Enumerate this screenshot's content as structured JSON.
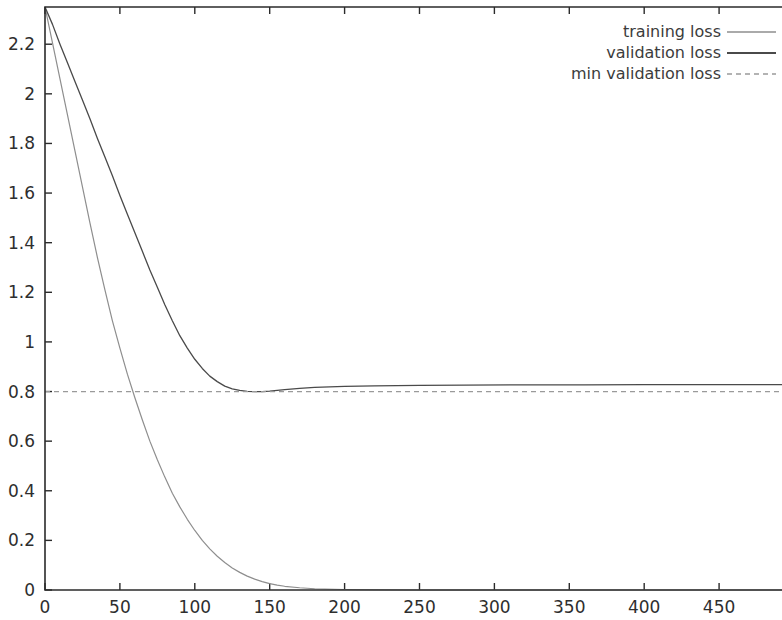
{
  "chart_data": {
    "type": "line",
    "title": "",
    "subtitle": "",
    "xlabel": "",
    "ylabel": "",
    "xlim": [
      0,
      492
    ],
    "ylim": [
      0,
      2.35
    ],
    "grid": false,
    "legend_position": "top-right",
    "x_ticks": [
      0,
      50,
      100,
      150,
      200,
      250,
      300,
      350,
      400,
      450
    ],
    "x_tick_labels": [
      "0",
      "50",
      "100",
      "150",
      "200",
      "250",
      "300",
      "350",
      "400",
      "450"
    ],
    "y_ticks": [
      0,
      0.2,
      0.4,
      0.6,
      0.8,
      1,
      1.2,
      1.4,
      1.6,
      1.8,
      2,
      2.2
    ],
    "y_tick_labels": [
      "0",
      "0.2",
      "0.4",
      "0.6",
      "0.8",
      "1",
      "1.2",
      "1.4",
      "1.6",
      "1.8",
      "2",
      "2.2"
    ],
    "annotations": [],
    "series": [
      {
        "name": "training loss",
        "style": "solid",
        "color": "#8e8e8e",
        "width": 1.2,
        "x": [
          0,
          5,
          10,
          15,
          20,
          25,
          30,
          35,
          40,
          45,
          50,
          55,
          60,
          65,
          70,
          75,
          80,
          85,
          90,
          95,
          100,
          105,
          110,
          115,
          120,
          125,
          130,
          135,
          140,
          145,
          150,
          155,
          160,
          170,
          180,
          200,
          220,
          250,
          280,
          320,
          360,
          400,
          440,
          492
        ],
        "values": [
          2.35,
          2.205,
          2.06,
          1.915,
          1.77,
          1.625,
          1.48,
          1.34,
          1.21,
          1.085,
          0.975,
          0.87,
          0.775,
          0.685,
          0.6,
          0.525,
          0.455,
          0.39,
          0.335,
          0.285,
          0.24,
          0.2,
          0.166,
          0.136,
          0.111,
          0.089,
          0.071,
          0.056,
          0.044,
          0.034,
          0.026,
          0.02,
          0.015,
          0.009,
          0.005,
          0.002,
          0.001,
          0.0,
          0.0,
          0.0,
          0.0,
          0.0,
          0.0,
          0.0
        ]
      },
      {
        "name": "validation loss",
        "style": "solid",
        "color": "#4a4a4a",
        "width": 1.3,
        "x": [
          0,
          5,
          10,
          15,
          20,
          25,
          30,
          35,
          40,
          45,
          50,
          55,
          60,
          65,
          70,
          75,
          80,
          85,
          90,
          95,
          100,
          105,
          110,
          115,
          120,
          125,
          130,
          135,
          140,
          145,
          150,
          155,
          160,
          170,
          180,
          200,
          220,
          250,
          280,
          320,
          360,
          400,
          440,
          492
        ],
        "values": [
          2.35,
          2.28,
          2.2,
          2.125,
          2.05,
          1.975,
          1.9,
          1.82,
          1.745,
          1.67,
          1.59,
          1.515,
          1.44,
          1.365,
          1.29,
          1.22,
          1.15,
          1.085,
          1.025,
          0.975,
          0.93,
          0.893,
          0.862,
          0.84,
          0.822,
          0.811,
          0.805,
          0.801,
          0.8,
          0.8,
          0.802,
          0.805,
          0.808,
          0.813,
          0.817,
          0.821,
          0.823,
          0.825,
          0.826,
          0.827,
          0.827,
          0.828,
          0.828,
          0.828
        ]
      },
      {
        "name": "min validation loss",
        "style": "dashed",
        "color": "#9a9a9a",
        "width": 1.2,
        "constant_value": 0.8,
        "x": [
          0,
          492
        ],
        "values": [
          0.8,
          0.8
        ]
      }
    ]
  },
  "legend": {
    "entries": [
      {
        "label": "training loss",
        "style": "solid",
        "color": "#8e8e8e"
      },
      {
        "label": "validation loss",
        "style": "solid",
        "color": "#4a4a4a"
      },
      {
        "label": "min validation loss",
        "style": "dashed",
        "color": "#9a9a9a"
      }
    ]
  },
  "colors": {
    "background": "#ffffff",
    "axis": "#2b2b2b",
    "text": "#2e2e2e",
    "training": "#8e8e8e",
    "validation": "#4a4a4a",
    "min_validation": "#9a9a9a"
  }
}
